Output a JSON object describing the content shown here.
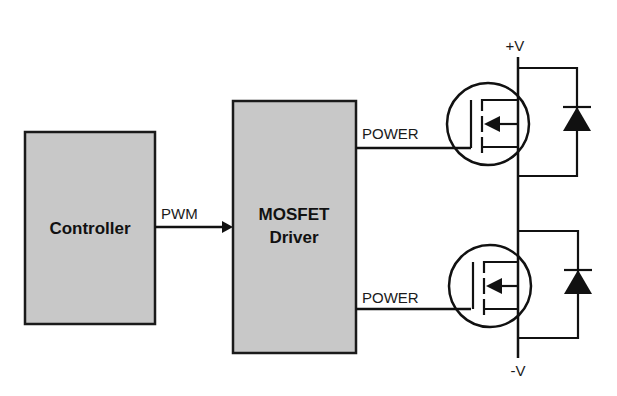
{
  "diagram": {
    "blocks": {
      "controller": {
        "label": "Controller"
      },
      "driver": {
        "line1": "MOSFET",
        "line2": "Driver"
      }
    },
    "signals": {
      "pwm": "PWM",
      "power_top": "POWER",
      "power_bottom": "POWER"
    },
    "rails": {
      "positive": "+V",
      "negative": "-V"
    },
    "components": {
      "top_switch": "mosfet-high-side",
      "bottom_switch": "mosfet-low-side",
      "top_diode": "flyback-diode-high",
      "bottom_diode": "flyback-diode-low"
    },
    "colors": {
      "block_fill": "#c8c8c8",
      "line": "#111111",
      "background": "#ffffff"
    }
  }
}
